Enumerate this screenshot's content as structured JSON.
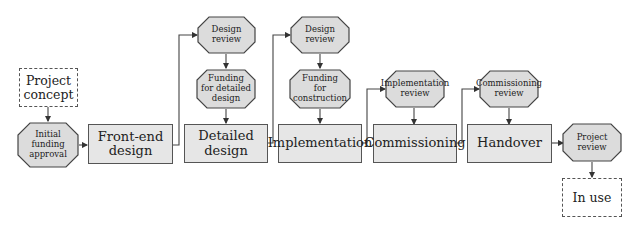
{
  "diagram": {
    "colors": {
      "stage_fill": "#e6e6e6",
      "gate_fill": "#dcdcdc",
      "stroke": "#444444",
      "background": "#ffffff"
    },
    "start": {
      "label": "Project concept",
      "line1": "Project",
      "line2": "concept"
    },
    "end": {
      "label": "In use"
    },
    "stages": [
      {
        "id": "front-end-design",
        "line1": "Front-end",
        "line2": "design"
      },
      {
        "id": "detailed-design",
        "line1": "Detailed",
        "line2": "design"
      },
      {
        "id": "implementation",
        "line1": "Implementation"
      },
      {
        "id": "commissioning",
        "line1": "Commissioning"
      },
      {
        "id": "handover",
        "line1": "Handover"
      }
    ],
    "gates": [
      {
        "id": "initial-funding-approval",
        "line1": "Initial",
        "line2": "funding",
        "line3": "approval"
      },
      {
        "id": "design-review-1",
        "line1": "Design",
        "line2": "review"
      },
      {
        "id": "funding-detailed-design",
        "line1": "Funding",
        "line2": "for detailed",
        "line3": "design"
      },
      {
        "id": "design-review-2",
        "line1": "Design",
        "line2": "review"
      },
      {
        "id": "funding-construction",
        "line1": "Funding",
        "line2": "for",
        "line3": "construction"
      },
      {
        "id": "implementation-review",
        "line1": "Implementation",
        "line2": "review"
      },
      {
        "id": "commissioning-review",
        "line1": "Commissioning",
        "line2": "review"
      },
      {
        "id": "project-review",
        "line1": "Project",
        "line2": "review"
      }
    ]
  }
}
